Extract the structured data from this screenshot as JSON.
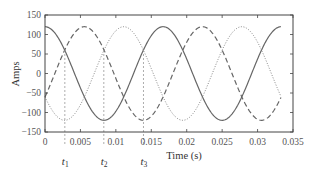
{
  "chart_data": {
    "type": "line",
    "title": "",
    "xlabel": "Time (s)",
    "ylabel": "Amps",
    "xlim": [
      0,
      0.035
    ],
    "ylim": [
      -150,
      150
    ],
    "x_ticks": [
      0,
      0.005,
      0.01,
      0.015,
      0.02,
      0.025,
      0.03,
      0.035
    ],
    "x_tick_labels": [
      "0",
      "0.005",
      "0.01",
      "0.015",
      "0.02",
      "0.025",
      "0.03",
      "0.035"
    ],
    "y_ticks": [
      -150,
      -100,
      -50,
      0,
      50,
      100,
      150
    ],
    "y_tick_labels": [
      "−150",
      "−100",
      "−50",
      "0",
      "50",
      "100",
      "150"
    ],
    "grid": false,
    "legend": null,
    "x_range_plotted": [
      0,
      0.0333
    ],
    "series": [
      {
        "name": "Phase a (solid)",
        "style": "solid",
        "color": "#666666",
        "amplitude": 120,
        "frequency_hz": 60,
        "phase_deg": 0
      },
      {
        "name": "Phase b (dashed)",
        "style": "dashed",
        "color": "#666666",
        "amplitude": 120,
        "frequency_hz": 60,
        "phase_deg": -120
      },
      {
        "name": "Phase c (dotted)",
        "style": "dotted",
        "color": "#888888",
        "amplitude": 120,
        "frequency_hz": 60,
        "phase_deg": 120
      }
    ],
    "annotations": [
      {
        "label": "t",
        "subscript": "1",
        "x": 0.0028
      },
      {
        "label": "t",
        "subscript": "2",
        "x": 0.0083
      },
      {
        "label": "t",
        "subscript": "3",
        "x": 0.0139
      }
    ]
  }
}
